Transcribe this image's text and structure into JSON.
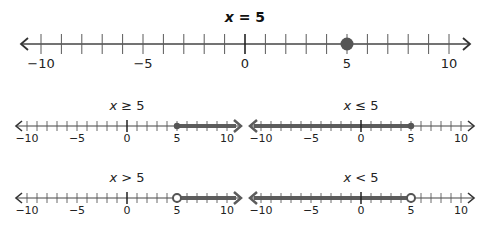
{
  "colors": {
    "axis": "#444444",
    "tick": "#5a5a5a",
    "zero_tick": "#222222",
    "ray": "#5c5c5c",
    "point": "#555555",
    "background": "#ffffff"
  },
  "chart_data": [
    {
      "type": "number_line",
      "title": "x = 5",
      "relation": "=",
      "point": 5,
      "point_style": "closed",
      "shaded": "none",
      "range": [
        -10,
        10
      ],
      "tick_step": 1,
      "tick_labels": [
        "−10",
        "−5",
        "0",
        "5",
        "10"
      ]
    },
    {
      "type": "number_line",
      "title": "x ≥ 5",
      "relation": ">=",
      "point": 5,
      "point_style": "closed",
      "shaded": "right",
      "range": [
        -10,
        10
      ],
      "tick_step": 1,
      "tick_labels": [
        "−10",
        "−5",
        "0",
        "5",
        "10"
      ]
    },
    {
      "type": "number_line",
      "title": "x ≤ 5",
      "relation": "<=",
      "point": 5,
      "point_style": "closed",
      "shaded": "left",
      "range": [
        -10,
        10
      ],
      "tick_step": 1,
      "tick_labels": [
        "−10",
        "−5",
        "0",
        "5",
        "10"
      ]
    },
    {
      "type": "number_line",
      "title": "x > 5",
      "relation": ">",
      "point": 5,
      "point_style": "open",
      "shaded": "right",
      "range": [
        -10,
        10
      ],
      "tick_step": 1,
      "tick_labels": [
        "−10",
        "−5",
        "0",
        "5",
        "10"
      ]
    },
    {
      "type": "number_line",
      "title": "x < 5",
      "relation": "<",
      "point": 5,
      "point_style": "open",
      "shaded": "left",
      "range": [
        -10,
        10
      ],
      "tick_step": 1,
      "tick_labels": [
        "−10",
        "−5",
        "0",
        "5",
        "10"
      ]
    }
  ],
  "lines": {
    "main": {
      "title_var": "x",
      "title_rest": " = 5",
      "labels": [
        "−10",
        "−5",
        "0",
        "5",
        "10"
      ]
    },
    "ge": {
      "title_var": "x",
      "title_rest": " ≥ 5",
      "labels": [
        "−10",
        "−5",
        "0",
        "5",
        "10"
      ]
    },
    "le": {
      "title_var": "x",
      "title_rest": " ≤ 5",
      "labels": [
        "−10",
        "−5",
        "0",
        "5",
        "10"
      ]
    },
    "gt": {
      "title_var": "x",
      "title_rest": " > 5",
      "labels": [
        "−10",
        "−5",
        "0",
        "5",
        "10"
      ]
    },
    "lt": {
      "title_var": "x",
      "title_rest": " < 5",
      "labels": [
        "−10",
        "−5",
        "0",
        "5",
        "10"
      ]
    }
  }
}
